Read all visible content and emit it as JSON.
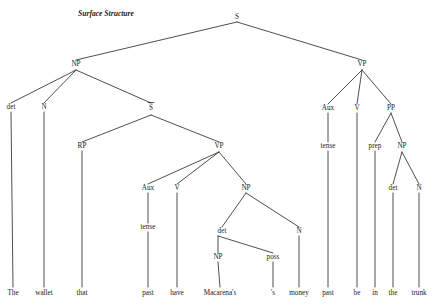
{
  "figure": {
    "caption": "Surface Structure",
    "caption_x": 78,
    "caption_y": 16,
    "type": "syntax-tree",
    "width": 435,
    "height": 306,
    "background": "#ffffff",
    "line_color": "#3b3b3b",
    "text_color": "#1a1a1a"
  },
  "sentence": "The wallet that past have Macarena's 's money past be in the trunk",
  "nodes": [
    {
      "id": "S",
      "label": "S",
      "x": 237,
      "y": 19,
      "overbar": false
    },
    {
      "id": "NP1",
      "label": "NP",
      "x": 76,
      "y": 66,
      "overbar": false
    },
    {
      "id": "VP_main",
      "label": "VP",
      "x": 362,
      "y": 66,
      "overbar": false
    },
    {
      "id": "det1",
      "label": "det",
      "x": 11,
      "y": 109,
      "overbar": false
    },
    {
      "id": "N1",
      "label": "N",
      "x": 44,
      "y": 109,
      "overbar": false
    },
    {
      "id": "Sbar",
      "label": "S",
      "x": 151,
      "y": 110,
      "overbar": true
    },
    {
      "id": "Aux_main",
      "label": "Aux",
      "x": 328,
      "y": 110,
      "overbar": false
    },
    {
      "id": "V_main",
      "label": "V",
      "x": 357,
      "y": 110,
      "overbar": false
    },
    {
      "id": "PP",
      "label": "PP",
      "x": 391,
      "y": 110,
      "overbar": false
    },
    {
      "id": "RP",
      "label": "RP",
      "x": 82,
      "y": 148,
      "overbar": false
    },
    {
      "id": "VP_rel",
      "label": "VP",
      "x": 219,
      "y": 148,
      "overbar": false
    },
    {
      "id": "tense_main",
      "label": "tense",
      "x": 328,
      "y": 148,
      "overbar": false
    },
    {
      "id": "prep",
      "label": "prep",
      "x": 375,
      "y": 148,
      "overbar": false
    },
    {
      "id": "NP_pp",
      "label": "NP",
      "x": 402,
      "y": 148,
      "overbar": false
    },
    {
      "id": "Aux_rel",
      "label": "Aux",
      "x": 148,
      "y": 190,
      "overbar": false
    },
    {
      "id": "V_rel",
      "label": "V",
      "x": 177,
      "y": 190,
      "overbar": false
    },
    {
      "id": "NP_obj",
      "label": "NP",
      "x": 246,
      "y": 190,
      "overbar": false
    },
    {
      "id": "det_pp",
      "label": "det",
      "x": 393,
      "y": 190,
      "overbar": false
    },
    {
      "id": "N_pp",
      "label": "N",
      "x": 419,
      "y": 190,
      "overbar": false
    },
    {
      "id": "tense_rel",
      "label": "tense",
      "x": 148,
      "y": 229,
      "overbar": false
    },
    {
      "id": "det_obj",
      "label": "det",
      "x": 222,
      "y": 233,
      "overbar": false
    },
    {
      "id": "N_obj",
      "label": "N",
      "x": 299,
      "y": 233,
      "overbar": false
    },
    {
      "id": "NP_poss",
      "label": "NP",
      "x": 218,
      "y": 259,
      "overbar": false
    },
    {
      "id": "poss",
      "label": "poss",
      "x": 273,
      "y": 259,
      "overbar": false
    }
  ],
  "leaves": [
    {
      "id": "w_the1",
      "label": "The",
      "x": 13,
      "y": 295,
      "parent": "det1",
      "stem_top": 112
    },
    {
      "id": "w_wallet",
      "label": "wallet",
      "x": 44,
      "y": 295,
      "parent": "N1",
      "stem_top": 112
    },
    {
      "id": "w_that",
      "label": "that",
      "x": 82,
      "y": 295,
      "parent": "RP",
      "stem_top": 151
    },
    {
      "id": "w_past1",
      "label": "past",
      "x": 148,
      "y": 295,
      "parent": "tense_rel",
      "stem_top": 232
    },
    {
      "id": "w_have",
      "label": "have",
      "x": 177,
      "y": 295,
      "parent": "V_rel",
      "stem_top": 193
    },
    {
      "id": "w_macar",
      "label": "Macarena's",
      "x": 220,
      "y": 295,
      "parent": "NP_poss",
      "stem_top": 262
    },
    {
      "id": "w_s",
      "label": "'s",
      "x": 273,
      "y": 295,
      "parent": "poss",
      "stem_top": 262
    },
    {
      "id": "w_money",
      "label": "money",
      "x": 299,
      "y": 295,
      "parent": "N_obj",
      "stem_top": 236
    },
    {
      "id": "w_past2",
      "label": "past",
      "x": 328,
      "y": 295,
      "parent": "tense_main",
      "stem_top": 151
    },
    {
      "id": "w_be",
      "label": "be",
      "x": 357,
      "y": 295,
      "parent": "V_main",
      "stem_top": 113
    },
    {
      "id": "w_in",
      "label": "in",
      "x": 375,
      "y": 295,
      "parent": "prep",
      "stem_top": 151
    },
    {
      "id": "w_the2",
      "label": "the",
      "x": 393,
      "y": 295,
      "parent": "det_pp",
      "stem_top": 193
    },
    {
      "id": "w_trunk",
      "label": "trunk",
      "x": 419,
      "y": 295,
      "parent": "N_pp",
      "stem_top": 193
    }
  ],
  "edges": [
    {
      "from": "S",
      "to": "NP1",
      "x1": 237,
      "y1": 22,
      "x2": 76,
      "y2": 60
    },
    {
      "from": "S",
      "to": "VP_main",
      "x1": 237,
      "y1": 22,
      "x2": 362,
      "y2": 60
    },
    {
      "from": "NP1",
      "to": "det1",
      "x1": 76,
      "y1": 70,
      "x2": 11,
      "y2": 103
    },
    {
      "from": "NP1",
      "to": "N1",
      "x1": 76,
      "y1": 70,
      "x2": 44,
      "y2": 103
    },
    {
      "from": "NP1",
      "to": "Sbar",
      "x1": 76,
      "y1": 70,
      "x2": 151,
      "y2": 103
    },
    {
      "from": "VP_main",
      "to": "Aux_main",
      "x1": 362,
      "y1": 70,
      "x2": 328,
      "y2": 104
    },
    {
      "from": "VP_main",
      "to": "V_main",
      "x1": 362,
      "y1": 70,
      "x2": 357,
      "y2": 104
    },
    {
      "from": "VP_main",
      "to": "PP",
      "x1": 362,
      "y1": 70,
      "x2": 391,
      "y2": 104
    },
    {
      "from": "Sbar",
      "to": "RP",
      "x1": 151,
      "y1": 115,
      "x2": 82,
      "y2": 142
    },
    {
      "from": "Sbar",
      "to": "VP_rel",
      "x1": 151,
      "y1": 115,
      "x2": 219,
      "y2": 142
    },
    {
      "from": "Aux_main",
      "to": "tense_main",
      "x1": 328,
      "y1": 113,
      "x2": 328,
      "y2": 142
    },
    {
      "from": "PP",
      "to": "prep",
      "x1": 391,
      "y1": 113,
      "x2": 375,
      "y2": 142
    },
    {
      "from": "PP",
      "to": "NP_pp",
      "x1": 391,
      "y1": 113,
      "x2": 402,
      "y2": 142
    },
    {
      "from": "VP_rel",
      "to": "Aux_rel",
      "x1": 219,
      "y1": 152,
      "x2": 148,
      "y2": 184
    },
    {
      "from": "VP_rel",
      "to": "V_rel",
      "x1": 219,
      "y1": 152,
      "x2": 177,
      "y2": 184
    },
    {
      "from": "VP_rel",
      "to": "NP_obj",
      "x1": 219,
      "y1": 152,
      "x2": 246,
      "y2": 184
    },
    {
      "from": "NP_pp",
      "to": "det_pp",
      "x1": 402,
      "y1": 152,
      "x2": 393,
      "y2": 184
    },
    {
      "from": "NP_pp",
      "to": "N_pp",
      "x1": 402,
      "y1": 152,
      "x2": 419,
      "y2": 184
    },
    {
      "from": "Aux_rel",
      "to": "tense_rel",
      "x1": 148,
      "y1": 193,
      "x2": 148,
      "y2": 223
    },
    {
      "from": "NP_obj",
      "to": "det_obj",
      "x1": 246,
      "y1": 193,
      "x2": 222,
      "y2": 227
    },
    {
      "from": "NP_obj",
      "to": "N_obj",
      "x1": 246,
      "y1": 193,
      "x2": 299,
      "y2": 227
    },
    {
      "from": "det_obj",
      "to": "NP_poss",
      "x1": 218,
      "y1": 236,
      "x2": 218,
      "y2": 253
    },
    {
      "from": "det_obj",
      "to": "poss",
      "x1": 218,
      "y1": 236,
      "x2": 273,
      "y2": 253
    }
  ]
}
